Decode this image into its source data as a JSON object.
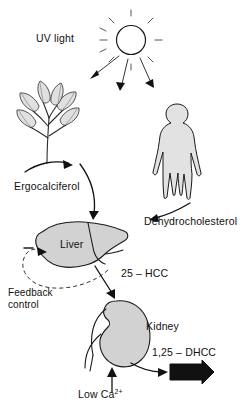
{
  "diagram": {
    "background_color": "#ffffff",
    "organ_fill_color": "#d2d2d2",
    "line_color": "#111111"
  },
  "labels": {
    "uv_light": "UV light",
    "ergocalciferol": "Ergocalciferol",
    "dehydrocholesterol": "Dehydrocholesterol",
    "liver": "Liver",
    "kidney": "Kidney",
    "hcc_25": "25 – HCC",
    "dhcc_125": "1,25 – DHCC",
    "feedback_line1": "Feedback",
    "feedback_line2": "control",
    "low_ca_text": "Low Ca",
    "low_ca_superscript": "2+"
  },
  "nodes": [
    {
      "name": "sun",
      "icon": "sun-icon",
      "label": "UV light"
    },
    {
      "name": "plant",
      "icon": "plant-icon",
      "label": ""
    },
    {
      "name": "human",
      "icon": "human-figure-icon",
      "label": ""
    },
    {
      "name": "liver",
      "icon": "liver-icon",
      "label": "Liver"
    },
    {
      "name": "kidney",
      "icon": "kidney-icon",
      "label": "Kidney"
    },
    {
      "name": "product",
      "icon": "block-arrow-icon",
      "label": "1,25 – DHCC"
    }
  ],
  "edges": [
    {
      "from": "sun",
      "to": "plant",
      "label": "",
      "style": "solid"
    },
    {
      "from": "sun",
      "to": "human",
      "label": "",
      "style": "solid"
    },
    {
      "from": "plant",
      "to": "liver",
      "label": "Ergocalciferol",
      "style": "solid"
    },
    {
      "from": "human",
      "to": "liver",
      "label": "Dehydrocholesterol",
      "style": "solid"
    },
    {
      "from": "liver",
      "to": "kidney",
      "label": "25 – HCC",
      "style": "solid"
    },
    {
      "from": "kidney",
      "to": "product",
      "label": "1,25 – DHCC",
      "style": "solid"
    },
    {
      "from": "low_calcium",
      "to": "kidney",
      "label": "Low Ca2+",
      "style": "solid"
    },
    {
      "from": "kidney",
      "to": "liver",
      "label": "Feedback control",
      "style": "dashed"
    }
  ]
}
